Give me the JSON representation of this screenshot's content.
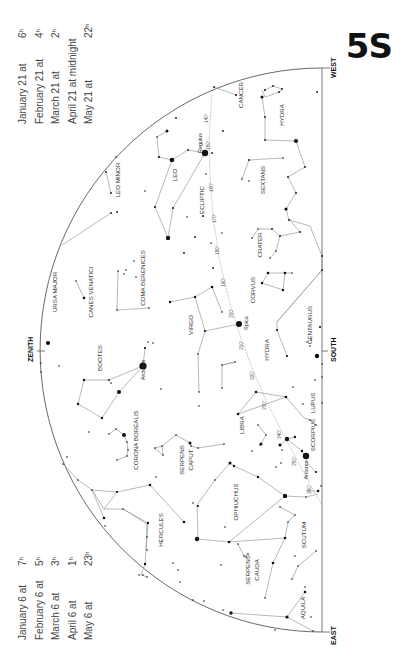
{
  "plate_label": "5S",
  "directions": {
    "west": "WEST",
    "east": "EAST",
    "south": "SOUTH",
    "zenith": "ZENITH"
  },
  "times_top": [
    {
      "date": "January 21 at",
      "time": "6",
      "sup": "h"
    },
    {
      "date": "February 21 at",
      "time": "4",
      "sup": "h"
    },
    {
      "date": "March 21 at",
      "time": "2",
      "sup": "h"
    },
    {
      "date": "April 21 at midnight",
      "time": "",
      "sup": ""
    },
    {
      "date": "May 21 at",
      "time": "22",
      "sup": "h"
    }
  ],
  "times_bottom": [
    {
      "date": "January 6 at",
      "time": "7",
      "sup": "h"
    },
    {
      "date": "February 6 at",
      "time": "5",
      "sup": "h"
    },
    {
      "date": "March 6 at",
      "time": "3",
      "sup": "h"
    },
    {
      "date": "April 6 at",
      "time": "1",
      "sup": "h"
    },
    {
      "date": "May 6 at",
      "time": "23",
      "sup": "h"
    }
  ],
  "constellations": [
    {
      "name": "CANCER",
      "x": 243,
      "y": 95
    },
    {
      "name": "HYDRA",
      "x": 284,
      "y": 115
    },
    {
      "name": "LEO MINOR",
      "x": 120,
      "y": 180
    },
    {
      "name": "LEO",
      "x": 177,
      "y": 175
    },
    {
      "name": "SEXTANS",
      "x": 265,
      "y": 180
    },
    {
      "name": "ECLIPTIC",
      "x": 204,
      "y": 200
    },
    {
      "name": "CRATER",
      "x": 262,
      "y": 245
    },
    {
      "name": "URSA MAJOR",
      "x": 57,
      "y": 292
    },
    {
      "name": "CANES VENATICI",
      "x": 93,
      "y": 292
    },
    {
      "name": "COMA BERENICES",
      "x": 145,
      "y": 278
    },
    {
      "name": "CORVUS",
      "x": 255,
      "y": 290
    },
    {
      "name": "VIRGO",
      "x": 193,
      "y": 325
    },
    {
      "name": "CENTAURUS",
      "x": 312,
      "y": 325
    },
    {
      "name": "HYDRA",
      "x": 269,
      "y": 350
    },
    {
      "name": "BOOTES",
      "x": 102,
      "y": 358
    },
    {
      "name": "LUPUS",
      "x": 315,
      "y": 403
    },
    {
      "name": "LIBRA",
      "x": 244,
      "y": 425
    },
    {
      "name": "SCORPIUS",
      "x": 315,
      "y": 435
    },
    {
      "name": "CORONA BOREALIS",
      "x": 138,
      "y": 440
    },
    {
      "name": "SERPENS",
      "x": 184,
      "y": 460
    },
    {
      "name": "CAPUT",
      "x": 193,
      "y": 460
    },
    {
      "name": "OPHIUCHUS",
      "x": 238,
      "y": 502
    },
    {
      "name": "HERCULES",
      "x": 163,
      "y": 530
    },
    {
      "name": "SCUTUM",
      "x": 306,
      "y": 535
    },
    {
      "name": "SERPENS",
      "x": 250,
      "y": 570
    },
    {
      "name": "CAUDA",
      "x": 259,
      "y": 570
    },
    {
      "name": "AQUILA",
      "x": 305,
      "y": 608
    }
  ],
  "named_stars": [
    {
      "name": "Regulus",
      "x": 202,
      "y": 143
    },
    {
      "name": "Spica",
      "x": 248,
      "y": 323
    },
    {
      "name": "Arcturus",
      "x": 145,
      "y": 370
    },
    {
      "name": "Antares",
      "x": 308,
      "y": 470
    }
  ],
  "ecliptic_degrees": [
    {
      "label": "140°",
      "x": 208,
      "y": 118
    },
    {
      "label": "150°",
      "x": 210,
      "y": 145
    },
    {
      "label": "160°",
      "x": 213,
      "y": 187
    },
    {
      "label": "170°",
      "x": 216,
      "y": 218
    },
    {
      "label": "180°",
      "x": 219,
      "y": 250
    },
    {
      "label": "190°",
      "x": 225,
      "y": 282
    },
    {
      "label": "200°",
      "x": 233,
      "y": 313
    },
    {
      "label": "210°",
      "x": 243,
      "y": 345
    },
    {
      "label": "220°",
      "x": 254,
      "y": 375
    },
    {
      "label": "230°",
      "x": 266,
      "y": 405
    },
    {
      "label": "240°",
      "x": 281,
      "y": 434
    },
    {
      "label": "250°",
      "x": 296,
      "y": 461
    },
    {
      "label": "260°",
      "x": 311,
      "y": 489
    }
  ]
}
